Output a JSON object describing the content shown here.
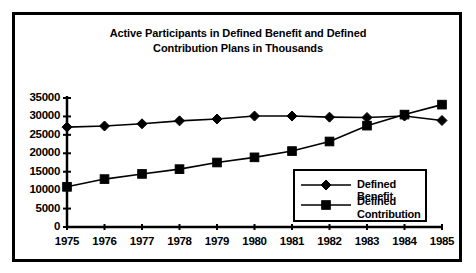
{
  "figure": {
    "background_color": "#ffffff",
    "frame_color": "#000000",
    "series_color": "#000000"
  },
  "chart_data": {
    "type": "line",
    "title": "Active Participants in Defined Benefit and Defined Contribution Plans in Thousands",
    "title_line1": "Active Participants in Defined Benefit and Defined",
    "title_line2": "Contribution Plans in Thousands",
    "xlabel": "",
    "ylabel": "",
    "grid": false,
    "legend_position": "inside-lower-right",
    "categories": [
      "1975",
      "1976",
      "1977",
      "1978",
      "1979",
      "1980",
      "1981",
      "1982",
      "1983",
      "1984",
      "1985"
    ],
    "x": [
      1975,
      1976,
      1977,
      1978,
      1979,
      1980,
      1981,
      1982,
      1983,
      1984,
      1985
    ],
    "ylim": [
      0,
      35000
    ],
    "yticks": [
      0,
      5000,
      10000,
      15000,
      20000,
      25000,
      30000,
      35000
    ],
    "ytick_labels": [
      "0",
      "5000",
      "10000",
      "15000",
      "20000",
      "25000",
      "30000",
      "35000"
    ],
    "xtick_labels": [
      "1975",
      "1976",
      "1977",
      "1978",
      "1979",
      "1980",
      "1981",
      "1982",
      "1983",
      "1984",
      "1985"
    ],
    "series": [
      {
        "name": "Defined Benefit",
        "marker": "diamond",
        "color": "#000000",
        "values": [
          27100,
          27400,
          28000,
          28800,
          29300,
          30100,
          30100,
          29800,
          29700,
          30100,
          28900
        ]
      },
      {
        "name": "Defined Contribution",
        "marker": "square",
        "color": "#000000",
        "values": [
          10900,
          13000,
          14400,
          15700,
          17500,
          18900,
          20600,
          23200,
          27500,
          30500,
          33200
        ]
      }
    ]
  },
  "legend": {
    "entries": [
      {
        "label": "Defined Benefit",
        "label_line1": "Defined Benefit",
        "label_line2": "",
        "marker": "diamond"
      },
      {
        "label": "Defined Contribution",
        "label_line1": "Defined",
        "label_line2": "Contribution",
        "marker": "square"
      }
    ]
  }
}
